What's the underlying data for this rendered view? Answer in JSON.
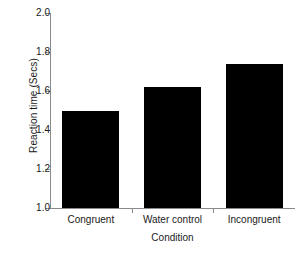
{
  "chart_data": {
    "type": "bar",
    "title": "",
    "categories": [
      "Congruent",
      "Water control",
      "Incongruent"
    ],
    "values": [
      1.5,
      1.62,
      1.74
    ],
    "xlabel": "Condition",
    "ylabel": "Reaction time (Secs)",
    "ylim": [
      1.0,
      2.0
    ],
    "yticks": [
      "1.0",
      "1.2",
      "1.4",
      "1.6",
      "1.8",
      "2.0"
    ],
    "ytick_values": [
      1.0,
      1.2,
      1.4,
      1.6,
      1.8,
      2.0
    ],
    "grid": false,
    "legend": false,
    "bar_color": "#000000",
    "axis_color": "#8a8a8a",
    "text_color": "#1a1a1a",
    "background": "#ffffff"
  }
}
